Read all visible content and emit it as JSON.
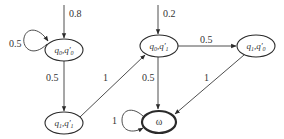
{
  "diagram": {
    "type": "state-transition-graph",
    "nodes": [
      {
        "id": "n1",
        "label": "q0,q'0",
        "base": "q",
        "sub1": "0",
        "sub2": "0",
        "cx": 64,
        "cy": 50,
        "accepting": false
      },
      {
        "id": "n2",
        "label": "q1,q'1",
        "base": "q",
        "sub1": "1",
        "sub2": "1",
        "cx": 64,
        "cy": 123,
        "accepting": false
      },
      {
        "id": "n3",
        "label": "q0,q'1",
        "base": "q",
        "sub1": "0",
        "sub2": "1",
        "cx": 159,
        "cy": 46,
        "accepting": false
      },
      {
        "id": "n4",
        "label": "q1,q'0",
        "base": "q",
        "sub1": "1",
        "sub2": "0",
        "cx": 256,
        "cy": 46,
        "accepting": false
      },
      {
        "id": "n5",
        "label": "ω",
        "cx": 159,
        "cy": 122,
        "accepting": true
      }
    ],
    "initial": [
      {
        "to": "n1",
        "prob": "0.8"
      },
      {
        "to": "n3",
        "prob": "0.2"
      }
    ],
    "edges": [
      {
        "from": "n1",
        "to": "n1",
        "prob": "0.5",
        "kind": "self-loop"
      },
      {
        "from": "n1",
        "to": "n2",
        "prob": "0.5"
      },
      {
        "from": "n2",
        "to": "n3",
        "prob": "1"
      },
      {
        "from": "n3",
        "to": "n4",
        "prob": "0.5"
      },
      {
        "from": "n3",
        "to": "n5",
        "prob": "0.5"
      },
      {
        "from": "n4",
        "to": "n5",
        "prob": "1"
      },
      {
        "from": "n5",
        "to": "n5",
        "prob": "1",
        "kind": "self-loop"
      }
    ]
  },
  "labels": {
    "init_n1": "0.8",
    "init_n3": "0.2",
    "loop_n1": "0.5",
    "n1_n2": "0.5",
    "n2_n3": "1",
    "n3_n4": "0.5",
    "n3_n5": "0.5",
    "n4_n5": "1",
    "loop_n5": "1",
    "omega": "ω"
  }
}
